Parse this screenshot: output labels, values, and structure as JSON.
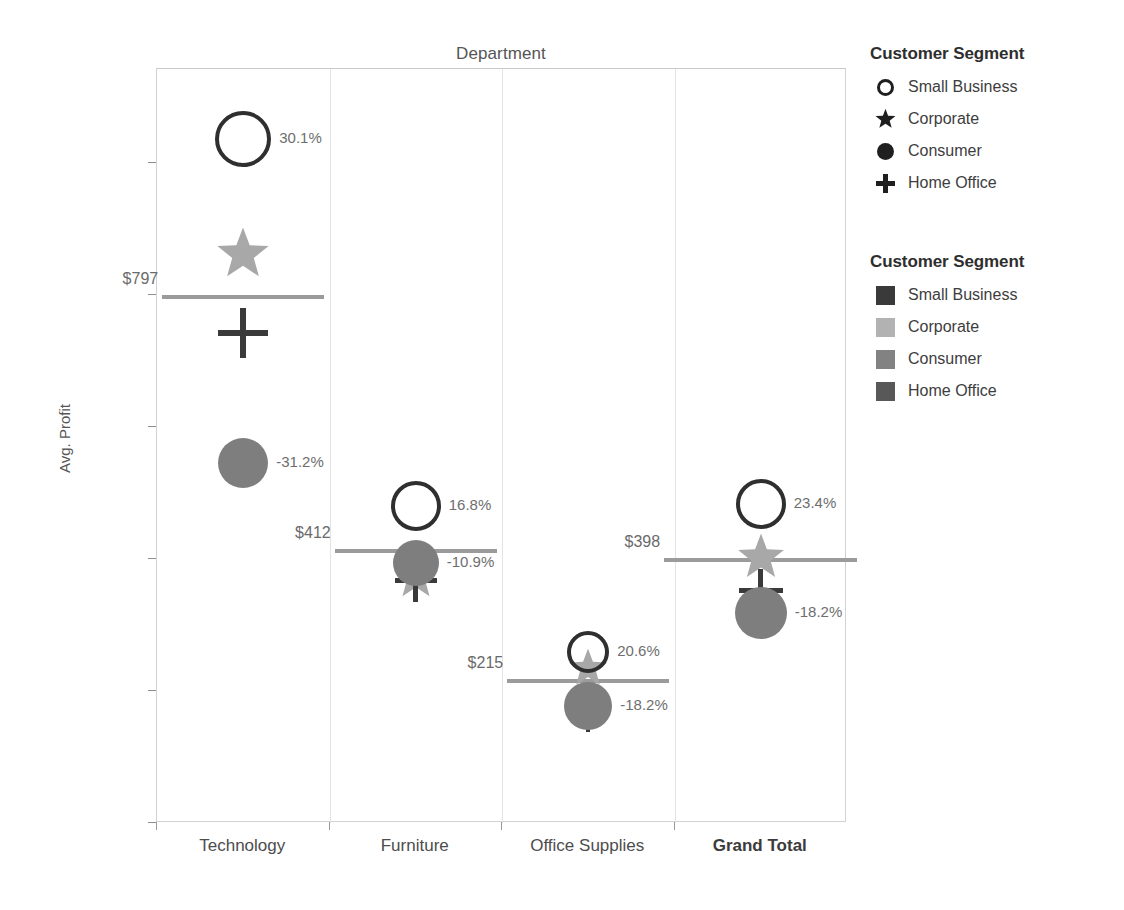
{
  "chart_data": {
    "type": "scatter",
    "title": "Department",
    "xlabel": "",
    "ylabel": "Avg. Profit",
    "ylim": [
      0,
      1100
    ],
    "yticks": [
      0,
      200,
      400,
      600,
      800,
      1000
    ],
    "ytick_labels": [
      "$0",
      "$200",
      "$400",
      "$600",
      "$800",
      "$1,000"
    ],
    "categories": [
      "Technology",
      "Furniture",
      "Office Supplies",
      "Grand Total"
    ],
    "grid": false,
    "legend_position": "right",
    "series": [
      {
        "name": "Small Business",
        "marker": "circle-open",
        "color": "#2f2f2f",
        "values": [
          1037,
          481,
          259,
          484
        ],
        "labels": [
          "30.1%",
          "16.8%",
          "20.6%",
          "23.4%"
        ]
      },
      {
        "name": "Corporate",
        "marker": "star",
        "color": "#a8a8a8",
        "values": [
          860,
          371,
          233,
          401
        ],
        "labels": [
          "",
          "",
          "",
          ""
        ]
      },
      {
        "name": "Consumer",
        "marker": "circle-filled",
        "color": "#7e7e7e",
        "values": [
          546,
          394,
          177,
          318
        ],
        "labels": [
          "-31.2%",
          "-10.9%",
          "-18.2%",
          "-18.2%"
        ]
      },
      {
        "name": "Home Office",
        "marker": "plus",
        "color": "#3a3a3a",
        "values": [
          743,
          367,
          163,
          352
        ],
        "labels": [
          "",
          "",
          "",
          ""
        ]
      }
    ],
    "reference_lines": [
      {
        "category": "Technology",
        "value": 797,
        "label": "$797"
      },
      {
        "category": "Furniture",
        "value": 412,
        "label": "$412"
      },
      {
        "category": "Office Supplies",
        "value": 215,
        "label": "$215"
      },
      {
        "category": "Grand Total",
        "value": 398,
        "label": "$398"
      }
    ]
  },
  "legends": [
    {
      "title": "Customer Segment",
      "type": "shape",
      "items": [
        {
          "label": "Small Business",
          "symbol": "circle-open-icon"
        },
        {
          "label": "Corporate",
          "symbol": "star-icon"
        },
        {
          "label": "Consumer",
          "symbol": "circle-filled-icon"
        },
        {
          "label": "Home Office",
          "symbol": "plus-icon"
        }
      ]
    },
    {
      "title": "Customer Segment",
      "type": "color",
      "items": [
        {
          "label": "Small Business",
          "symbol": "swatch-icon",
          "color": "#3a3a3a"
        },
        {
          "label": "Corporate",
          "symbol": "swatch-icon",
          "color": "#b2b2b2"
        },
        {
          "label": "Consumer",
          "symbol": "swatch-icon",
          "color": "#828282"
        },
        {
          "label": "Home Office",
          "symbol": "swatch-icon",
          "color": "#585858"
        }
      ]
    }
  ]
}
